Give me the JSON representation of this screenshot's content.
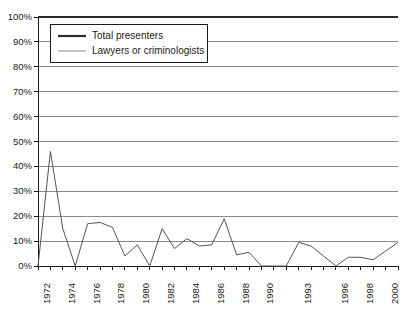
{
  "chart_data": {
    "type": "line",
    "title": "",
    "subtitle": "",
    "xlabel": "",
    "ylabel": "",
    "ylim": [
      0,
      100
    ],
    "ytick_labels": [
      "0%",
      "10%",
      "20%",
      "30%",
      "40%",
      "50%",
      "60%",
      "70%",
      "80%",
      "90%",
      "100%"
    ],
    "ytick_values": [
      0,
      10,
      20,
      30,
      40,
      50,
      60,
      70,
      80,
      90,
      100
    ],
    "grid": "horizontal",
    "legend_position": "top-left-inside",
    "x": [
      1972,
      1973,
      1974,
      1975,
      1976,
      1977,
      1978,
      1979,
      1980,
      1981,
      1982,
      1983,
      1984,
      1985,
      1986,
      1987,
      1988,
      1989,
      1990,
      1991,
      1992,
      1993,
      1994,
      1995,
      1996,
      1997,
      1998,
      1999,
      2000,
      2001
    ],
    "xtick_labels": [
      "1972",
      "1974",
      "1976",
      "1978",
      "1980",
      "1982",
      "1984",
      "1986",
      "1988",
      "1990",
      "1993",
      "1996",
      "1998",
      "2000"
    ],
    "xtick_label_positions": [
      1972,
      1974,
      1976,
      1978,
      1980,
      1982,
      1984,
      1986,
      1988,
      1990,
      1993,
      1996,
      1998,
      2000
    ],
    "series": [
      {
        "name": "Total presenters",
        "color": "#2b2b2b",
        "width": 2.2,
        "values": [
          100,
          100,
          100,
          100,
          100,
          100,
          100,
          100,
          100,
          100,
          100,
          100,
          100,
          100,
          100,
          100,
          100,
          100,
          100,
          100,
          100,
          100,
          100,
          100,
          100,
          100,
          100,
          100,
          100,
          100
        ]
      },
      {
        "name": "Lawyers or criminologists",
        "color": "#555555",
        "width": 1.0,
        "values": [
          0,
          46,
          15,
          0,
          17,
          17.5,
          15.5,
          4,
          8.5,
          0,
          15,
          7,
          11,
          8,
          8.5,
          19,
          4.5,
          5.5,
          0,
          0,
          0,
          9.5,
          8,
          4,
          0,
          3.5,
          3.5,
          2.5,
          6,
          9.5
        ]
      }
    ],
    "legend": [
      {
        "label": "Total presenters",
        "color": "#2b2b2b",
        "width": 2.2
      },
      {
        "label": "Lawyers or criminologists",
        "color": "#888888",
        "width": 1.0
      }
    ],
    "axis": {
      "left": 38,
      "right": 398,
      "top": 17,
      "bottom": 266
    },
    "colors": {
      "axis": "#1a1a1a",
      "grid": "#8a8a8a",
      "background": "#ffffff",
      "text": "#1a1a1a"
    }
  }
}
